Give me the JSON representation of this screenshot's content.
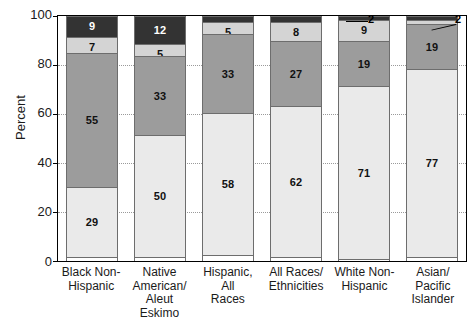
{
  "chart_data": {
    "type": "bar",
    "subtype": "stacked-bar-100-percent",
    "title": "",
    "xlabel": "",
    "ylabel": "Percent",
    "ylim": [
      0,
      100
    ],
    "yticks": [
      0,
      20,
      40,
      60,
      80,
      100
    ],
    "grid": true,
    "grid_style": "dotted-horizontal",
    "legend": "none",
    "stack_order": "bottom-to-top",
    "categories": [
      "Black Non-Hispanic",
      "Native American/Aleut Eskimo",
      "Hispanic, All Races",
      "All Races/Ethnicities",
      "White Non-Hispanic",
      "Asian/Pacific Islander"
    ],
    "category_label_lines": [
      [
        "Black Non-",
        "Hispanic"
      ],
      [
        "Native",
        "American/",
        "Aleut",
        "Eskimo"
      ],
      [
        "Hispanic,",
        "All",
        "Races"
      ],
      [
        "All Races/",
        "Ethnicities"
      ],
      [
        "White Non-",
        "Hispanic"
      ],
      [
        "Asian/",
        "Pacific",
        "Islander"
      ]
    ],
    "series": [
      {
        "name": "segment-1-bottom",
        "color": "#eaeaea",
        "values": [
          29,
          50,
          58,
          62,
          71,
          77
        ]
      },
      {
        "name": "segment-2",
        "color": "#9c9c9c",
        "values": [
          55,
          33,
          33,
          27,
          19,
          19
        ]
      },
      {
        "name": "segment-3",
        "color": "#d4d4d4",
        "values": [
          7,
          5,
          5,
          8,
          9,
          2
        ]
      },
      {
        "name": "segment-4-top",
        "color": "#333333",
        "values": [
          9,
          12,
          3,
          3,
          2,
          2
        ]
      }
    ],
    "bars": [
      {
        "category": "Black Non-Hispanic",
        "segments": [
          {
            "value": 29,
            "label": "29",
            "color": "#eaeaea",
            "label_visible": true,
            "callout": false
          },
          {
            "value": 55,
            "label": "55",
            "color": "#9c9c9c",
            "label_visible": true,
            "callout": false
          },
          {
            "value": 7,
            "label": "7",
            "color": "#d4d4d4",
            "label_visible": true,
            "callout": false
          },
          {
            "value": 9,
            "label": "9",
            "color": "#333333",
            "label_visible": true,
            "callout": false
          }
        ]
      },
      {
        "category": "Native American/Aleut Eskimo",
        "segments": [
          {
            "value": 50,
            "label": "50",
            "color": "#eaeaea",
            "label_visible": true,
            "callout": false
          },
          {
            "value": 33,
            "label": "33",
            "color": "#9c9c9c",
            "label_visible": true,
            "callout": false
          },
          {
            "value": 5,
            "label": "5",
            "color": "#d4d4d4",
            "label_visible": true,
            "callout": false
          },
          {
            "value": 12,
            "label": "12",
            "color": "#333333",
            "label_visible": true,
            "callout": false
          }
        ]
      },
      {
        "category": "Hispanic, All Races",
        "segments": [
          {
            "value": 58,
            "label": "58",
            "color": "#eaeaea",
            "label_visible": true,
            "callout": false
          },
          {
            "value": 33,
            "label": "33",
            "color": "#9c9c9c",
            "label_visible": true,
            "callout": false
          },
          {
            "value": 5,
            "label": "5",
            "color": "#d4d4d4",
            "label_visible": true,
            "callout": false
          },
          {
            "value": 3,
            "label": "3",
            "color": "#333333",
            "label_visible": true,
            "callout": false
          }
        ]
      },
      {
        "category": "All Races/Ethnicities",
        "segments": [
          {
            "value": 62,
            "label": "62",
            "color": "#eaeaea",
            "label_visible": true,
            "callout": false
          },
          {
            "value": 27,
            "label": "27",
            "color": "#9c9c9c",
            "label_visible": true,
            "callout": false
          },
          {
            "value": 8,
            "label": "8",
            "color": "#d4d4d4",
            "label_visible": true,
            "callout": false
          },
          {
            "value": 3,
            "label": "3",
            "color": "#333333",
            "label_visible": true,
            "callout": false
          }
        ]
      },
      {
        "category": "White Non-Hispanic",
        "segments": [
          {
            "value": 71,
            "label": "71",
            "color": "#eaeaea",
            "label_visible": true,
            "callout": false
          },
          {
            "value": 19,
            "label": "19",
            "color": "#9c9c9c",
            "label_visible": true,
            "callout": false
          },
          {
            "value": 9,
            "label": "9",
            "color": "#d4d4d4",
            "label_visible": true,
            "callout": false
          },
          {
            "value": 2,
            "label": "2",
            "color": "#333333",
            "label_visible": false,
            "callout": true
          }
        ]
      },
      {
        "category": "Asian/Pacific Islander",
        "segments": [
          {
            "value": 77,
            "label": "77",
            "color": "#eaeaea",
            "label_visible": true,
            "callout": false
          },
          {
            "value": 19,
            "label": "19",
            "color": "#9c9c9c",
            "label_visible": true,
            "callout": false
          },
          {
            "value": 2,
            "label": "2",
            "color": "#d4d4d4",
            "label_visible": false,
            "callout": false
          },
          {
            "value": 2,
            "label": "2",
            "color": "#333333",
            "label_visible": false,
            "callout": true
          }
        ]
      }
    ],
    "callouts": [
      {
        "text": "2",
        "points_to": "White Non-Hispanic top segment"
      },
      {
        "text": "2",
        "points_to": "Asian/Pacific Islander top segment"
      }
    ]
  },
  "axis": {
    "y_title": "Percent",
    "y_tick_labels": [
      "100",
      "80",
      "60",
      "40",
      "20",
      "0"
    ]
  }
}
